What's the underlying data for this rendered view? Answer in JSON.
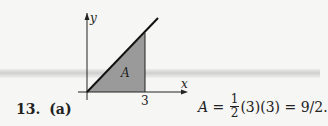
{
  "problem": {
    "number": "13.",
    "part": "(a)"
  },
  "figure": {
    "y_axis_label": "y",
    "x_axis_label": "x",
    "tick_label": "3",
    "region_label": "A",
    "fill_color": "#9a9a9a",
    "line_color": "#111111"
  },
  "equation": {
    "lhs": "A",
    "equals": " = ",
    "frac_num": "1",
    "frac_den": "2",
    "rest": "(3)(3) = 9/2."
  }
}
